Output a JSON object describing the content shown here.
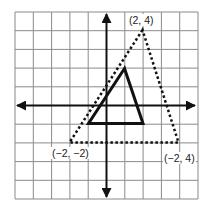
{
  "figure": {
    "type": "coordinate-grid-dilation",
    "grid": {
      "cells_x": 10,
      "cells_y": 10,
      "line_color": "#8a8a8a"
    },
    "axes": {
      "color": "#111111",
      "arrows": [
        "left",
        "right",
        "up",
        "down"
      ]
    },
    "shapes": [
      {
        "name": "original-triangle",
        "style": "solid",
        "color": "#111111"
      },
      {
        "name": "dilated-triangle",
        "style": "dotted",
        "color": "#111111"
      }
    ],
    "labels": {
      "top_vertex": "(2, 4)",
      "bottom_left_vertex": "(−2, −2)",
      "bottom_right_vertex": "(−2, 4)"
    }
  }
}
